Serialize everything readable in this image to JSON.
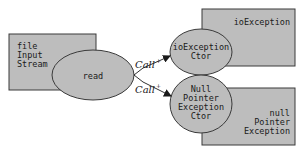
{
  "diagram": {
    "type": "call-graph",
    "colors": {
      "fill": "#bdbdbd",
      "stroke": "#3a3a3a",
      "text": "#1a1a1a",
      "background": "#ffffff"
    },
    "boxes": [
      {
        "id": "fileInputStream",
        "lines": [
          "file",
          "Input",
          "Stream"
        ]
      },
      {
        "id": "ioException",
        "lines": [
          "ioException"
        ]
      },
      {
        "id": "nullPointerException",
        "lines": [
          "null",
          "Pointer",
          "Exception"
        ]
      }
    ],
    "nodes": [
      {
        "id": "read",
        "lines": [
          "read"
        ]
      },
      {
        "id": "ioExceptionCtor",
        "lines": [
          "ioException",
          "Ctor"
        ]
      },
      {
        "id": "npeCtor",
        "lines": [
          "Null",
          "Pointer",
          "Exception",
          "Ctor"
        ]
      }
    ],
    "edges": [
      {
        "from": "read",
        "to": "ioExceptionCtor",
        "label": "Call",
        "superscript": "+"
      },
      {
        "from": "read",
        "to": "npeCtor",
        "label": "Call",
        "superscript": "+"
      }
    ]
  }
}
